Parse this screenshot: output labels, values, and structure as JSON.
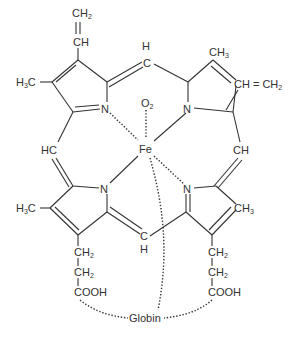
{
  "diagram": {
    "title": "",
    "type": "chemical-structure",
    "molecule": "heme-globin complex",
    "labels": {
      "tl_vinyl_ch2": {
        "main": "CH",
        "sub": "2"
      },
      "tl_vinyl_ch": "CH",
      "tl_methyl": {
        "pre": "H",
        "sub": "3",
        "post": "C"
      },
      "top_methine_h": "H",
      "top_methine_c": "C",
      "tr_methyl": {
        "main": "CH",
        "sub": "3"
      },
      "tr_vinyl": {
        "main": "CH = CH",
        "sub": "2"
      },
      "oxygen": {
        "main": "O",
        "sub": "2"
      },
      "iron": "Fe",
      "left_methine": "HC",
      "right_methine": "CH",
      "bl_methyl": {
        "pre": "H",
        "sub": "3",
        "post": "C"
      },
      "br_methyl": {
        "main": "CH",
        "sub": "3"
      },
      "bottom_methine_c": "C",
      "bottom_methine_h": "H",
      "nitrogen": "N",
      "left_chain": [
        {
          "main": "CH",
          "sub": "2"
        },
        {
          "main": "CH",
          "sub": "2"
        },
        {
          "main": "COOH",
          "sub": ""
        }
      ],
      "right_chain": [
        {
          "main": "CH",
          "sub": "2"
        },
        {
          "main": "CH",
          "sub": "2"
        },
        {
          "main": "COOH",
          "sub": ""
        }
      ],
      "globin": "Globin"
    },
    "colors": {
      "line": "#333333",
      "text": "#333333",
      "background": "#ffffff"
    }
  }
}
